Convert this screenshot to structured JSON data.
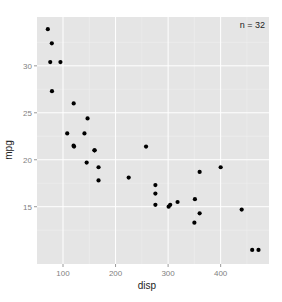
{
  "chart_data": {
    "type": "scatter",
    "title": "",
    "xlabel": "disp",
    "ylabel": "mpg",
    "annotation": "n = 32",
    "xlim": [
      50.5,
      492
    ],
    "ylim": [
      8.9,
      35.2
    ],
    "xticks": [
      100,
      200,
      300,
      400
    ],
    "yticks": [
      15,
      20,
      25,
      30
    ],
    "grid": true,
    "legend": "none",
    "colors": {
      "panel": "#e5e5e5",
      "grid_major": "#ffffff",
      "grid_minor": "#f0f0f0",
      "point": "#000000"
    },
    "points": [
      {
        "x": 160.0,
        "y": 21.0
      },
      {
        "x": 160.0,
        "y": 21.0
      },
      {
        "x": 108.0,
        "y": 22.8
      },
      {
        "x": 258.0,
        "y": 21.4
      },
      {
        "x": 360.0,
        "y": 18.7
      },
      {
        "x": 225.0,
        "y": 18.1
      },
      {
        "x": 360.0,
        "y": 14.3
      },
      {
        "x": 146.7,
        "y": 24.4
      },
      {
        "x": 140.8,
        "y": 22.8
      },
      {
        "x": 167.6,
        "y": 19.2
      },
      {
        "x": 167.6,
        "y": 17.8
      },
      {
        "x": 275.8,
        "y": 16.4
      },
      {
        "x": 275.8,
        "y": 17.3
      },
      {
        "x": 275.8,
        "y": 15.2
      },
      {
        "x": 472.0,
        "y": 10.4
      },
      {
        "x": 460.0,
        "y": 10.4
      },
      {
        "x": 440.0,
        "y": 14.7
      },
      {
        "x": 78.7,
        "y": 32.4
      },
      {
        "x": 75.7,
        "y": 30.4
      },
      {
        "x": 71.1,
        "y": 33.9
      },
      {
        "x": 120.1,
        "y": 21.5
      },
      {
        "x": 318.0,
        "y": 15.5
      },
      {
        "x": 304.0,
        "y": 15.2
      },
      {
        "x": 350.0,
        "y": 13.3
      },
      {
        "x": 400.0,
        "y": 19.2
      },
      {
        "x": 79.0,
        "y": 27.3
      },
      {
        "x": 120.3,
        "y": 26.0
      },
      {
        "x": 95.1,
        "y": 30.4
      },
      {
        "x": 351.0,
        "y": 15.8
      },
      {
        "x": 145.0,
        "y": 19.7
      },
      {
        "x": 301.0,
        "y": 15.0
      },
      {
        "x": 121.0,
        "y": 21.4
      }
    ]
  },
  "labels": {
    "x_title": "disp",
    "y_title": "mpg",
    "count": "n = 32",
    "xticks": [
      "100",
      "200",
      "300",
      "400"
    ],
    "yticks": [
      "15",
      "20",
      "25",
      "30"
    ]
  }
}
